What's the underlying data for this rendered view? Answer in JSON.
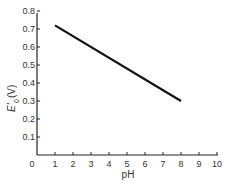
{
  "chart_data": {
    "type": "line",
    "title": "",
    "xlabel": "pH",
    "ylabel": "E'0 (V)",
    "ylabel_main": "E'",
    "ylabel_sub": "0",
    "ylabel_unit": "(V)",
    "xlim": [
      0,
      10
    ],
    "ylim": [
      0,
      0.8
    ],
    "x_ticks": [
      "0",
      "1",
      "2",
      "3",
      "4",
      "5",
      "6",
      "7",
      "8",
      "9",
      "10"
    ],
    "y_ticks": [
      "0.1",
      "0.2",
      "0.3",
      "0.4",
      "0.5",
      "0.6",
      "0.7",
      "0.8"
    ],
    "grid": false,
    "legend": null,
    "series": [
      {
        "name": "E'0 vs pH",
        "x": [
          1,
          8
        ],
        "y": [
          0.72,
          0.3
        ],
        "color": "#111111"
      }
    ]
  }
}
